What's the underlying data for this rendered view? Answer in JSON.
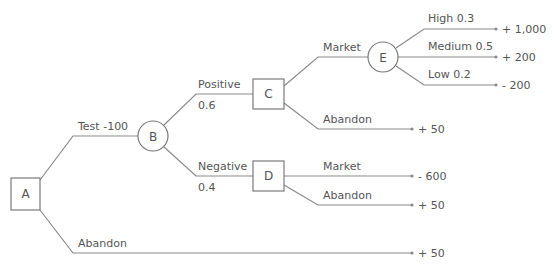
{
  "diagram": {
    "type": "decision-tree",
    "colors": {
      "line": "#8a8a8a",
      "text": "#555555",
      "background": "#ffffff"
    },
    "nodes": {
      "A": {
        "label": "A",
        "kind": "decision"
      },
      "B": {
        "label": "B",
        "kind": "chance"
      },
      "C": {
        "label": "C",
        "kind": "decision"
      },
      "D": {
        "label": "D",
        "kind": "decision"
      },
      "E": {
        "label": "E",
        "kind": "chance"
      }
    },
    "branches": {
      "a_test": {
        "label": "Test  -100",
        "from": "A",
        "to": "B"
      },
      "a_abandon": {
        "label": "Abandon",
        "from": "A",
        "payoff": "+ 50"
      },
      "b_positive": {
        "label": "Positive",
        "prob": "0.6",
        "from": "B",
        "to": "C"
      },
      "b_negative": {
        "label": "Negative",
        "prob": "0.4",
        "from": "B",
        "to": "D"
      },
      "c_market": {
        "label": "Market",
        "from": "C",
        "to": "E"
      },
      "c_abandon": {
        "label": "Abandon",
        "from": "C",
        "payoff": "+ 50"
      },
      "d_market": {
        "label": "Market",
        "from": "D",
        "payoff": "- 600"
      },
      "d_abandon": {
        "label": "Abandon",
        "from": "D",
        "payoff": "+ 50"
      },
      "e_high": {
        "label": "High 0.3",
        "from": "E",
        "payoff": "+ 1,000"
      },
      "e_medium": {
        "label": "Medium 0.5",
        "from": "E",
        "payoff": "+ 200"
      },
      "e_low": {
        "label": "Low 0.2",
        "from": "E",
        "payoff": "- 200"
      }
    }
  }
}
